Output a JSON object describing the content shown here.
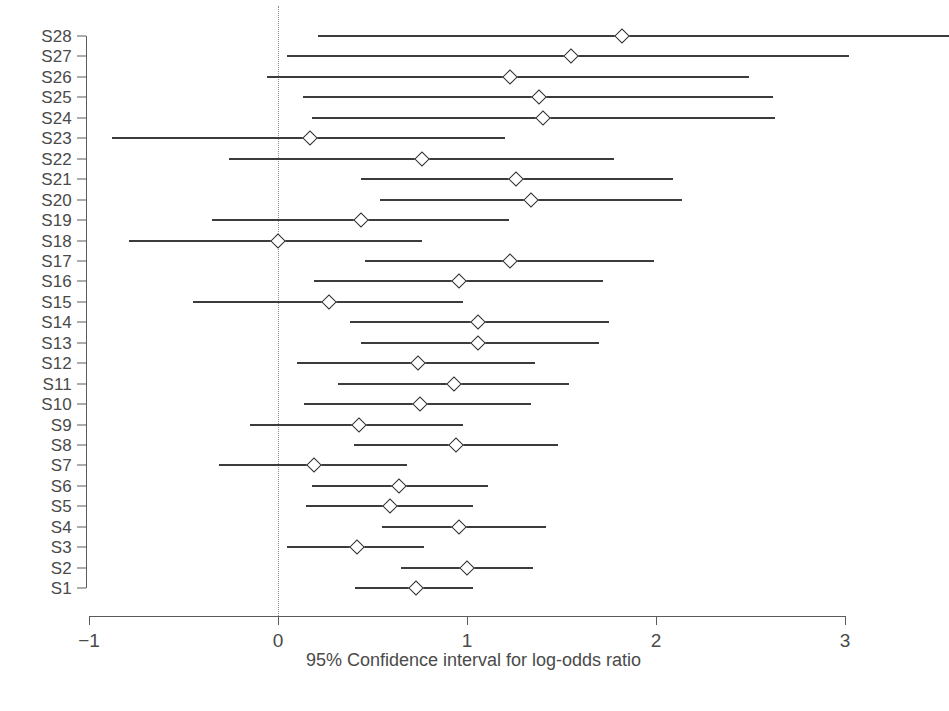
{
  "chart_data": {
    "type": "line",
    "title": "",
    "xlabel": "95% Confidence interval for log-odds ratio",
    "ylabel": "",
    "xlim": [
      -1,
      3
    ],
    "ylim": [
      0.5,
      28.5
    ],
    "grid": false,
    "legend": null,
    "xticks": [
      -1,
      0,
      1,
      2,
      3
    ],
    "xticklabels": [
      "−1",
      "0",
      "1",
      "2",
      "3"
    ],
    "reference_line": 0,
    "reference_line_style": "dotted",
    "categories": [
      "S28",
      "S27",
      "S26",
      "S25",
      "S24",
      "S23",
      "S22",
      "S21",
      "S20",
      "S19",
      "S18",
      "S17",
      "S16",
      "S15",
      "S14",
      "S13",
      "S12",
      "S11",
      "S10",
      "S9",
      "S8",
      "S7",
      "S6",
      "S5",
      "S4",
      "S3",
      "S2",
      "S1"
    ],
    "studies": [
      {
        "label": "S28",
        "estimate": 1.82,
        "ci_low": 0.21,
        "ci_high": 3.55
      },
      {
        "label": "S27",
        "estimate": 1.55,
        "ci_low": 0.05,
        "ci_high": 3.02
      },
      {
        "label": "S26",
        "estimate": 1.23,
        "ci_low": -0.06,
        "ci_high": 2.49
      },
      {
        "label": "S25",
        "estimate": 1.38,
        "ci_low": 0.13,
        "ci_high": 2.62
      },
      {
        "label": "S24",
        "estimate": 1.4,
        "ci_low": 0.18,
        "ci_high": 2.63
      },
      {
        "label": "S23",
        "estimate": 0.17,
        "ci_low": -0.88,
        "ci_high": 1.2
      },
      {
        "label": "S22",
        "estimate": 0.76,
        "ci_low": -0.26,
        "ci_high": 1.78
      },
      {
        "label": "S21",
        "estimate": 1.26,
        "ci_low": 0.44,
        "ci_high": 2.09
      },
      {
        "label": "S20",
        "estimate": 1.34,
        "ci_low": 0.54,
        "ci_high": 2.14
      },
      {
        "label": "S19",
        "estimate": 0.44,
        "ci_low": -0.35,
        "ci_high": 1.22
      },
      {
        "label": "S18",
        "estimate": 0.0,
        "ci_low": -0.79,
        "ci_high": 0.76
      },
      {
        "label": "S17",
        "estimate": 1.23,
        "ci_low": 0.46,
        "ci_high": 1.99
      },
      {
        "label": "S16",
        "estimate": 0.96,
        "ci_low": 0.19,
        "ci_high": 1.72
      },
      {
        "label": "S15",
        "estimate": 0.27,
        "ci_low": -0.45,
        "ci_high": 0.98
      },
      {
        "label": "S14",
        "estimate": 1.06,
        "ci_low": 0.38,
        "ci_high": 1.75
      },
      {
        "label": "S13",
        "estimate": 1.06,
        "ci_low": 0.44,
        "ci_high": 1.7
      },
      {
        "label": "S12",
        "estimate": 0.74,
        "ci_low": 0.1,
        "ci_high": 1.36
      },
      {
        "label": "S11",
        "estimate": 0.93,
        "ci_low": 0.32,
        "ci_high": 1.54
      },
      {
        "label": "S10",
        "estimate": 0.75,
        "ci_low": 0.14,
        "ci_high": 1.34
      },
      {
        "label": "S9",
        "estimate": 0.43,
        "ci_low": -0.15,
        "ci_high": 0.98
      },
      {
        "label": "S8",
        "estimate": 0.94,
        "ci_low": 0.4,
        "ci_high": 1.48
      },
      {
        "label": "S7",
        "estimate": 0.19,
        "ci_low": -0.31,
        "ci_high": 0.68
      },
      {
        "label": "S6",
        "estimate": 0.64,
        "ci_low": 0.18,
        "ci_high": 1.11
      },
      {
        "label": "S5",
        "estimate": 0.59,
        "ci_low": 0.15,
        "ci_high": 1.03
      },
      {
        "label": "S4",
        "estimate": 0.96,
        "ci_low": 0.55,
        "ci_high": 1.42
      },
      {
        "label": "S3",
        "estimate": 0.42,
        "ci_low": 0.05,
        "ci_high": 0.77
      },
      {
        "label": "S2",
        "estimate": 1.0,
        "ci_low": 0.65,
        "ci_high": 1.35
      },
      {
        "label": "S1",
        "estimate": 0.73,
        "ci_low": 0.41,
        "ci_high": 1.03
      }
    ]
  },
  "axis": {
    "x_title": "95% Confidence interval for log-odds ratio",
    "x_tick_labels": [
      "−1",
      "0",
      "1",
      "2",
      "3"
    ]
  },
  "colors": {
    "line": "#3c3c3c",
    "marker_edge": "#2e2e2e",
    "marker_fill": "#ffffff",
    "axis": "#5a5a5a",
    "reference": "#8a8a8a",
    "text": "#4a4a4a",
    "background": "#ffffff"
  }
}
